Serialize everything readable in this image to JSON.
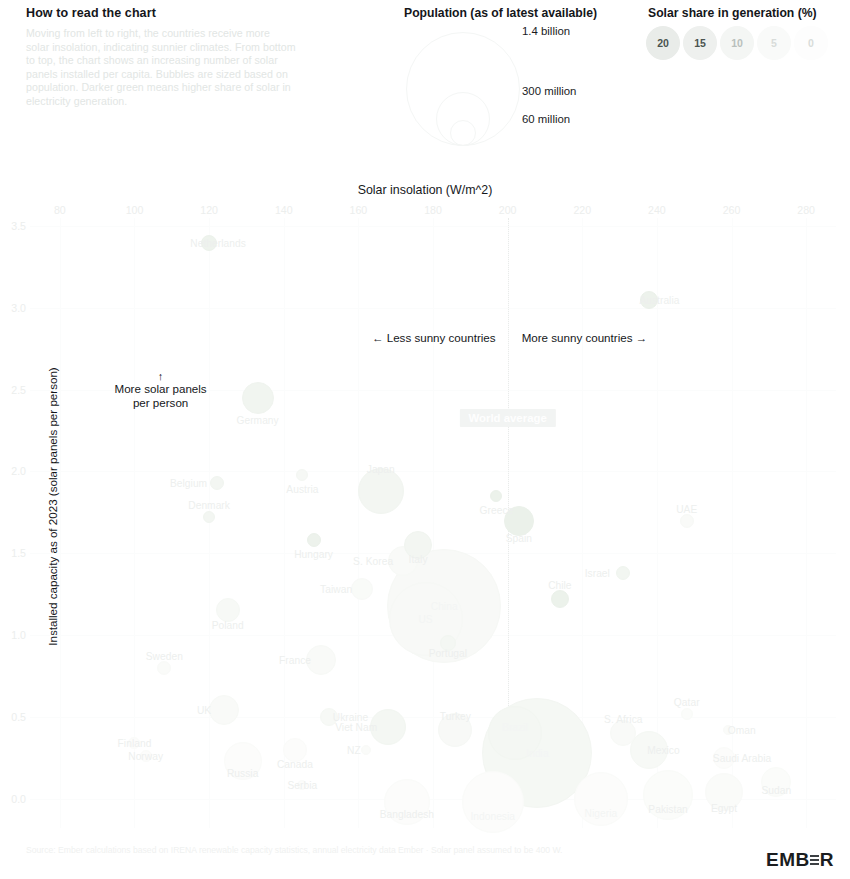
{
  "howto": {
    "title": "How to read the chart",
    "body": "Moving from left to right, the countries receive more solar insolation, indicating sunnier climates. From bottom to top, the chart shows an increasing number of solar panels installed per capita. Bubbles are sized based on population. Darker green means higher share of solar in electricity generation."
  },
  "legend": {
    "population_title": "Population (as of latest available)",
    "population_items": [
      {
        "label": "1.4 billion",
        "r": 56
      },
      {
        "label": "300 million",
        "r": 26
      },
      {
        "label": "60 million",
        "r": 12
      }
    ],
    "share_title": "Solar share in generation (%)",
    "share_items": [
      {
        "label": "20",
        "color": "#e9ece9"
      },
      {
        "label": "15",
        "color": "#eef0ee"
      },
      {
        "label": "10",
        "color": "#f4f6f4"
      },
      {
        "label": "5",
        "color": "#f9faf9"
      },
      {
        "label": "0",
        "color": "#fdfdfd"
      }
    ]
  },
  "annotations": {
    "less_sunny": "← Less sunny countries",
    "more_sunny": "More sunny countries →",
    "more_panels_arrow": "↑",
    "more_panels": "More solar panels\nper person",
    "more_panels_line1": "More solar panels",
    "more_panels_line2": "per person",
    "world_average": "World average"
  },
  "footer": {
    "source": "Source: Ember calculations based on IRENA renewable capacity statistics, annual electricity data Ember · Solar panel assumed to be 400 W.",
    "logo": "EMB",
    "logo_end": "R"
  },
  "chart_data": {
    "type": "scatter",
    "title": "",
    "xlabel": "Solar insolation (W/m^2)",
    "ylabel": "Installed capacity as of 2023 (solar panels per person)",
    "xlim": [
      72,
      288
    ],
    "ylim": [
      -0.18,
      3.55
    ],
    "xticks": [
      80,
      100,
      120,
      140,
      160,
      180,
      200,
      220,
      240,
      260,
      280
    ],
    "yticks": [
      "0.0",
      "0.5",
      "1.0",
      "1.5",
      "2.0",
      "2.5",
      "3.0",
      "3.5"
    ],
    "ytick_values": [
      0.0,
      0.5,
      1.0,
      1.5,
      2.0,
      2.5,
      3.0,
      3.5
    ],
    "grid": true,
    "legend_position": "top-right",
    "reference_lines": [
      {
        "axis": "x",
        "value": 200,
        "label": "World average",
        "style": "dotted"
      }
    ],
    "size_encodes": "population",
    "color_encodes": "solar share in generation (%)",
    "points": [
      {
        "name": "Netherlands",
        "x": 120,
        "y": 3.4,
        "r": 7,
        "share": 17,
        "lab_dx": 9,
        "lab_dy": 0
      },
      {
        "name": "Australia",
        "x": 238,
        "y": 3.05,
        "r": 8,
        "share": 18,
        "lab_dx": 10,
        "lab_dy": 0
      },
      {
        "name": "Germany",
        "x": 133,
        "y": 2.45,
        "r": 15,
        "share": 13,
        "lab_dx": 0,
        "lab_dy": 22
      },
      {
        "name": "Belgium",
        "x": 122,
        "y": 1.93,
        "r": 6,
        "share": 11,
        "lab_dx": -28,
        "lab_dy": 0
      },
      {
        "name": "Austria",
        "x": 145,
        "y": 1.98,
        "r": 5,
        "share": 8,
        "lab_dx": 0,
        "lab_dy": 14
      },
      {
        "name": "Japan",
        "x": 166,
        "y": 1.88,
        "r": 22,
        "share": 11,
        "lab_dx": 0,
        "lab_dy": -22
      },
      {
        "name": "Greece",
        "x": 197,
        "y": 1.85,
        "r": 5,
        "share": 19,
        "lab_dx": 0,
        "lab_dy": 14
      },
      {
        "name": "Denmark",
        "x": 120,
        "y": 1.72,
        "r": 5,
        "share": 11,
        "lab_dx": 0,
        "lab_dy": -12
      },
      {
        "name": "Spain",
        "x": 203,
        "y": 1.7,
        "r": 14,
        "share": 20,
        "lab_dx": 0,
        "lab_dy": 17
      },
      {
        "name": "UAE",
        "x": 248,
        "y": 1.7,
        "r": 6,
        "share": 5,
        "lab_dx": 0,
        "lab_dy": -12
      },
      {
        "name": "Hungary",
        "x": 148,
        "y": 1.58,
        "r": 6,
        "share": 18,
        "lab_dx": 0,
        "lab_dy": 14
      },
      {
        "name": "Italy",
        "x": 176,
        "y": 1.55,
        "r": 13,
        "share": 11,
        "lab_dx": 0,
        "lab_dy": 14
      },
      {
        "name": "S. Korea",
        "x": 172,
        "y": 1.45,
        "r": 14,
        "share": 5,
        "lab_dx": -30,
        "lab_dy": 0
      },
      {
        "name": "Israel",
        "x": 231,
        "y": 1.38,
        "r": 6,
        "share": 12,
        "lab_dx": -26,
        "lab_dy": 0
      },
      {
        "name": "Taiwan",
        "x": 161,
        "y": 1.28,
        "r": 10,
        "share": 4,
        "lab_dx": -26,
        "lab_dy": 0
      },
      {
        "name": "China",
        "x": 183,
        "y": 1.18,
        "r": 56,
        "share": 6,
        "lab_dx": 0,
        "lab_dy": 0
      },
      {
        "name": "Chile",
        "x": 214,
        "y": 1.22,
        "r": 8,
        "share": 19,
        "lab_dx": 0,
        "lab_dy": -14
      },
      {
        "name": "Poland",
        "x": 125,
        "y": 1.15,
        "r": 11,
        "share": 7,
        "lab_dx": 0,
        "lab_dy": 15
      },
      {
        "name": "US",
        "x": 178,
        "y": 1.1,
        "r": 36,
        "share": 6,
        "lab_dx": 0,
        "lab_dy": 0
      },
      {
        "name": "Portugal",
        "x": 184,
        "y": 0.95,
        "r": 7,
        "share": 10,
        "lab_dx": 0,
        "lab_dy": 10
      },
      {
        "name": "France",
        "x": 150,
        "y": 0.85,
        "r": 14,
        "share": 5,
        "lab_dx": -26,
        "lab_dy": 0
      },
      {
        "name": "Sweden",
        "x": 108,
        "y": 0.8,
        "r": 6,
        "share": 3,
        "lab_dx": 0,
        "lab_dy": -12
      },
      {
        "name": "UK",
        "x": 124,
        "y": 0.54,
        "r": 14,
        "share": 5,
        "lab_dx": -20,
        "lab_dy": 0
      },
      {
        "name": "Ukraine",
        "x": 152,
        "y": 0.5,
        "r": 8,
        "share": 7,
        "lab_dx": 22,
        "lab_dy": 0
      },
      {
        "name": "Qatar",
        "x": 248,
        "y": 0.52,
        "r": 5,
        "share": 2,
        "lab_dx": 0,
        "lab_dy": -12
      },
      {
        "name": "Viet Nam",
        "x": 168,
        "y": 0.44,
        "r": 17,
        "share": 10,
        "lab_dx": -32,
        "lab_dy": 0
      },
      {
        "name": "Turkey",
        "x": 186,
        "y": 0.42,
        "r": 16,
        "share": 6,
        "lab_dx": 0,
        "lab_dy": -14
      },
      {
        "name": "Brazil",
        "x": 202,
        "y": 0.4,
        "r": 26,
        "share": 10,
        "lab_dx": 0,
        "lab_dy": -6
      },
      {
        "name": "S. Africa",
        "x": 231,
        "y": 0.4,
        "r": 12,
        "share": 5,
        "lab_dx": 0,
        "lab_dy": -14
      },
      {
        "name": "Oman",
        "x": 259,
        "y": 0.42,
        "r": 4,
        "share": 3,
        "lab_dx": 14,
        "lab_dy": 0
      },
      {
        "name": "Finland",
        "x": 100,
        "y": 0.34,
        "r": 5,
        "share": 1,
        "lab_dx": 0,
        "lab_dy": 0
      },
      {
        "name": "India",
        "x": 208,
        "y": 0.28,
        "r": 54,
        "share": 9,
        "lab_dx": 0,
        "lab_dy": 0
      },
      {
        "name": "Mexico",
        "x": 238,
        "y": 0.3,
        "r": 18,
        "share": 7,
        "lab_dx": 14,
        "lab_dy": 0
      },
      {
        "name": "Canada",
        "x": 143,
        "y": 0.3,
        "r": 11,
        "share": 1,
        "lab_dx": 0,
        "lab_dy": 14
      },
      {
        "name": "Norway",
        "x": 103,
        "y": 0.26,
        "r": 5,
        "share": 1,
        "lab_dx": 0,
        "lab_dy": 0
      },
      {
        "name": "Russia",
        "x": 129,
        "y": 0.23,
        "r": 18,
        "share": 1,
        "lab_dx": 0,
        "lab_dy": 12
      },
      {
        "name": "Saudi Arabia",
        "x": 258,
        "y": 0.25,
        "r": 10,
        "share": 1,
        "lab_dx": 18,
        "lab_dy": 0
      },
      {
        "name": "NZ",
        "x": 162,
        "y": 0.3,
        "r": 4,
        "share": 3,
        "lab_dx": -12,
        "lab_dy": 0
      },
      {
        "name": "Serbia",
        "x": 145,
        "y": 0.08,
        "r": 4,
        "share": 1,
        "lab_dx": 0,
        "lab_dy": 0
      },
      {
        "name": "Indonesia",
        "x": 196,
        "y": -0.02,
        "r": 30,
        "share": 1,
        "lab_dx": 0,
        "lab_dy": 14
      },
      {
        "name": "Bangladesh",
        "x": 173,
        "y": -0.02,
        "r": 22,
        "share": 1,
        "lab_dx": 0,
        "lab_dy": 12
      },
      {
        "name": "Nigeria",
        "x": 225,
        "y": 0.0,
        "r": 26,
        "share": 1,
        "lab_dx": 0,
        "lab_dy": 14
      },
      {
        "name": "Pakistan",
        "x": 243,
        "y": 0.02,
        "r": 24,
        "share": 2,
        "lab_dx": 0,
        "lab_dy": 14
      },
      {
        "name": "Egypt",
        "x": 258,
        "y": 0.04,
        "r": 18,
        "share": 3,
        "lab_dx": 0,
        "lab_dy": 16
      },
      {
        "name": "Sudan",
        "x": 272,
        "y": 0.1,
        "r": 14,
        "share": 2,
        "lab_dx": 0,
        "lab_dy": 8
      }
    ]
  }
}
